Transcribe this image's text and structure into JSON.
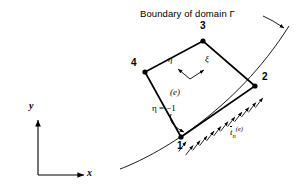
{
  "figure": {
    "kind": "fem-boundary-element-diagram",
    "background_color": "#ffffff",
    "stroke_color": "#000000",
    "width": 300,
    "height": 194
  },
  "title": {
    "boundary_label": "Boundary of domain Γ"
  },
  "nodes": [
    {
      "id": "1",
      "label": "1",
      "x": 181,
      "y": 137,
      "label_x": 177,
      "label_y": 143
    },
    {
      "id": "2",
      "label": "2",
      "x": 255,
      "y": 86,
      "label_x": 261,
      "label_y": 76
    },
    {
      "id": "3",
      "label": "3",
      "x": 203,
      "y": 41,
      "label_x": 200,
      "label_y": 25
    },
    {
      "id": "4",
      "label": "4",
      "x": 145,
      "y": 72,
      "label_x": 132,
      "label_y": 62
    }
  ],
  "element": {
    "label": "(e)",
    "label_x": 177,
    "label_y": 92
  },
  "local_axes": {
    "origin_x": 190,
    "origin_y": 79,
    "eta": {
      "label": "η",
      "tip_x": 177,
      "tip_y": 68,
      "label_x": 170,
      "label_y": 58
    },
    "xi": {
      "label": "ξ",
      "tip_x": 205,
      "tip_y": 69,
      "label_x": 206,
      "label_y": 58
    }
  },
  "edge_annotation": {
    "label": "η = −1",
    "label_x": 158,
    "label_y": 108,
    "leader_from_x": 171,
    "leader_from_y": 117,
    "leader_to_x": 186,
    "leader_to_y": 133
  },
  "traction": {
    "symbol_base": "t",
    "subscript": "n",
    "superscript": "(e)",
    "label_x": 232,
    "label_y": 130,
    "arrow_count": 12,
    "description": "normal traction arrows on edge 1-2"
  },
  "global_axes": {
    "origin_x": 38,
    "origin_y": 175,
    "x_tip_x": 86,
    "x_tip_y": 175,
    "y_tip_x": 38,
    "y_tip_y": 118,
    "x_label": "x",
    "y_label": "y",
    "x_label_x": 89,
    "x_label_y": 170,
    "y_label_x": 30,
    "y_label_y": 104
  },
  "leader": {
    "from_x": 263,
    "from_y": 16,
    "mid_x": 273,
    "mid_y": 21,
    "to_x": 284,
    "to_y": 28
  },
  "boundary_curve": {
    "start_x": 120,
    "start_y": 169,
    "c1_x": 155,
    "c1_y": 156,
    "c2_x": 235,
    "c2_y": 112,
    "end_x": 289,
    "end_y": 26
  }
}
